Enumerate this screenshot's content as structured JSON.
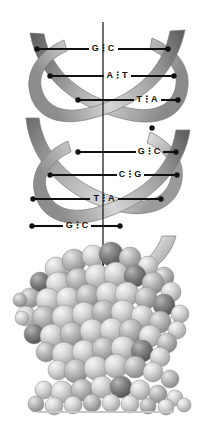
{
  "figure": {
    "name": "dna-double-helix-and-space-filling-model",
    "background_color": "#ffffff",
    "width": 211,
    "height": 427
  },
  "axis": {
    "name": "central-helix-axis",
    "color": "#222222",
    "x": 103,
    "y_top": 22,
    "y_bottom": 348
  },
  "ribbon": {
    "strand_light": "#d0d0d0",
    "strand_mid": "#9a9a9a",
    "strand_dark": "#5a5a5a",
    "edge_color": "#777777"
  },
  "base_pairs": [
    {
      "id": "bp1",
      "left": "G",
      "right": "C",
      "bonds": 3,
      "label": "G⋮C",
      "y": 49,
      "x_left": 37,
      "x_right": 168,
      "label_x": 103
    },
    {
      "id": "bp2",
      "left": "A",
      "right": "T",
      "bonds": 2,
      "label": "A⋮T",
      "y": 76,
      "x_left": 50,
      "x_right": 174,
      "label_x": 117
    },
    {
      "id": "bp3",
      "left": "T",
      "right": "A",
      "bonds": 2,
      "label": "T⋮A",
      "y": 100,
      "x_left": 78,
      "x_right": 178,
      "label_x": 147
    },
    {
      "id": "bp4",
      "left": "G",
      "right": "C",
      "bonds": 3,
      "label": "G⋮C",
      "y": 152,
      "x_left": 78,
      "x_right": 176,
      "label_x": 149
    },
    {
      "id": "bp5",
      "left": "C",
      "right": "G",
      "bonds": 3,
      "label": "C⋮G",
      "y": 175,
      "x_left": 50,
      "x_right": 177,
      "label_x": 130
    },
    {
      "id": "bp6",
      "left": "T",
      "right": "A",
      "bonds": 2,
      "label": "T⋮A",
      "y": 199,
      "x_left": 33,
      "x_right": 161,
      "label_x": 104
    },
    {
      "id": "bp7",
      "left": "G",
      "right": "C",
      "bonds": 3,
      "label": "G⋮C",
      "y": 226,
      "x_left": 32,
      "x_right": 120,
      "label_x": 77
    }
  ],
  "markers": {
    "name": "strand-attachment-dots",
    "color": "#111111",
    "radius": 2.6,
    "extra": [
      {
        "x": 152,
        "y": 128
      },
      {
        "x": 118,
        "y": 252
      }
    ]
  },
  "space_filling_model": {
    "name": "cpk-space-filling-dna-model",
    "sphere_light": "#dcdcdc",
    "sphere_mid": "#b4b4b4",
    "sphere_dark": "#6e6e6e",
    "highlight": "#f2f2f2",
    "outline": "#8a8a8a",
    "baseline_color": "#bdbdbd",
    "baseline_y": 412,
    "top_y": 250
  }
}
